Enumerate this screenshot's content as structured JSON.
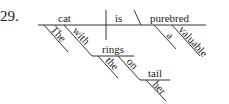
{
  "problem_number": "29.",
  "diagram": {
    "type": "sentence-diagram",
    "sentence": "The cat with the rings on her tail is a valuable purebred",
    "baseline": {
      "subject": "cat",
      "verb": "is",
      "predicate_nominative": "purebred"
    },
    "modifiers": {
      "subject": [
        "The",
        "with"
      ],
      "with_object": "rings",
      "rings_modifiers": [
        "the",
        "on"
      ],
      "on_object": "tail",
      "tail_modifiers": [
        "her"
      ],
      "predicate_modifiers": [
        "a",
        "valuable"
      ]
    }
  }
}
